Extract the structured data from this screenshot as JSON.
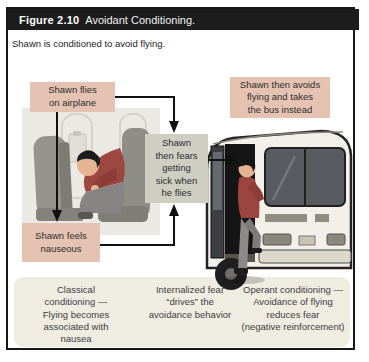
{
  "figure": {
    "label": "Figure 2.10",
    "title": "Avoidant Conditioning.",
    "subtitle": "Shawn is conditioned to avoid flying."
  },
  "diagram": {
    "boxes": [
      {
        "id": "shawn-flies",
        "text": "Shawn flies\non airplane",
        "color": "#e5c2b2"
      },
      {
        "id": "shawn-avoids",
        "text": "Shawn then avoids\nflying and takes\nthe bus instead",
        "color": "#e5c2b2"
      },
      {
        "id": "shawn-fears",
        "text": "Shawn\nthen fears\ngetting\nsick when\nhe flies",
        "color": "#cfcec3"
      },
      {
        "id": "shawn-nauseous",
        "text": "Shawn feels\nnauseous",
        "color": "#e5c2b2"
      }
    ],
    "captions": [
      {
        "text": "Classical\nconditioning —\nFlying becomes\nassociated with\nnausea"
      },
      {
        "text": "Internalized fear\n“drives” the\navoidance behavior"
      },
      {
        "text": "Operant conditioning —\nAvoidance of flying\nreduces fear\n(negative reinforcement)"
      }
    ],
    "illustrations": [
      {
        "name": "passenger-sick-on-airplane"
      },
      {
        "name": "man-boarding-bus"
      }
    ]
  },
  "colors": {
    "header_bar": "#1c1c1c",
    "header_text": "#ffffff",
    "pink_box": "#e5c2b2",
    "gray_box": "#cfcec3",
    "caption_panel": "#efece2",
    "arrow": "#111111"
  }
}
